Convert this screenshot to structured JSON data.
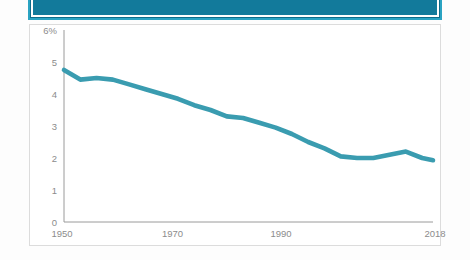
{
  "banner": {
    "name": "top-teal-banner",
    "color": "#127a9b",
    "border_color": "#2aa3c2"
  },
  "card": {
    "background": "#ffffff",
    "border_color": "#dcdcdc"
  },
  "chart_data": {
    "type": "line",
    "title": "",
    "subtitle": "",
    "xlabel": "",
    "ylabel": "",
    "grid": false,
    "legend": "none",
    "line_color": "#3a9cb0",
    "axis_color": "#9a9a9a",
    "tick_color": "#8c8c8c",
    "xlim": [
      1950,
      2018
    ],
    "ylim": [
      0,
      6
    ],
    "y_tick_labels": [
      "6%",
      "5",
      "4",
      "3",
      "2",
      "1",
      "0"
    ],
    "y_tick_values": [
      6,
      5,
      4,
      3,
      2,
      1,
      0
    ],
    "x_tick_labels": [
      "1950",
      "1970",
      "1990",
      "2018"
    ],
    "x_tick_values": [
      1950,
      1970,
      1990,
      2018
    ],
    "series": [
      {
        "name": "rate",
        "x": [
          1950,
          1953,
          1956,
          1959,
          1962,
          1965,
          1968,
          1971,
          1974,
          1977,
          1980,
          1983,
          1986,
          1989,
          1992,
          1995,
          1998,
          2001,
          2004,
          2007,
          2010,
          2013,
          2016,
          2018
        ],
        "values": [
          4.75,
          4.45,
          4.5,
          4.45,
          4.3,
          4.15,
          4.0,
          3.85,
          3.65,
          3.5,
          3.3,
          3.25,
          3.1,
          2.95,
          2.75,
          2.5,
          2.3,
          2.05,
          2.0,
          2.0,
          2.1,
          2.2,
          2.0,
          1.93
        ]
      }
    ]
  }
}
